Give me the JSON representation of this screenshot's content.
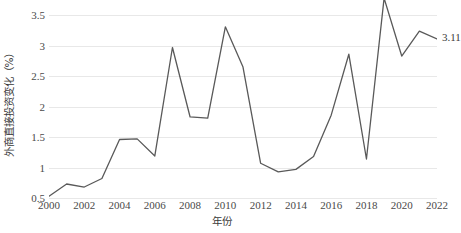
{
  "chart_data": {
    "type": "line",
    "title": "",
    "xlabel": "年份",
    "ylabel": "外商直接投资变化（%）",
    "x": [
      2000,
      2001,
      2002,
      2003,
      2004,
      2005,
      2006,
      2007,
      2008,
      2009,
      2010,
      2011,
      2012,
      2013,
      2014,
      2015,
      2016,
      2017,
      2018,
      2019,
      2020,
      2021,
      2022
    ],
    "values": [
      0.53,
      0.73,
      0.68,
      0.82,
      1.46,
      1.47,
      1.19,
      2.97,
      1.83,
      1.81,
      3.31,
      2.65,
      1.07,
      0.93,
      0.97,
      1.18,
      1.86,
      2.86,
      1.14,
      3.78,
      2.83,
      3.24,
      3.11
    ],
    "series": [
      {
        "name": "外商直接投资变化",
        "values": [
          0.53,
          0.73,
          0.68,
          0.82,
          1.46,
          1.47,
          1.19,
          2.97,
          1.83,
          1.81,
          3.31,
          2.65,
          1.07,
          0.93,
          0.97,
          1.18,
          1.86,
          2.86,
          1.14,
          3.78,
          2.83,
          3.24,
          3.11
        ],
        "color": "#595959"
      }
    ],
    "xlim": [
      2000,
      2022
    ],
    "ylim": [
      0.5,
      3.75
    ],
    "xticks": [
      2000,
      2002,
      2004,
      2006,
      2008,
      2010,
      2012,
      2014,
      2016,
      2018,
      2020,
      2022
    ],
    "xtick_labels": [
      "2000",
      "2002",
      "2004",
      "2006",
      "2008",
      "2010",
      "2012",
      "2014",
      "2016",
      "2018",
      "2020",
      "2022"
    ],
    "yticks": [
      0.5,
      1,
      1.5,
      2,
      2.5,
      3,
      3.5
    ],
    "ytick_labels": [
      "0.5",
      "1",
      "1.5",
      "2",
      "2.5",
      "3",
      "3.5"
    ],
    "grid": "horizontal",
    "legend": "none",
    "annotations": [
      {
        "text": "3.11",
        "x": 2022,
        "y": 3.11
      }
    ],
    "colors": {
      "line": "#595959",
      "gridline": "#e8e8e8",
      "text": "#3a3a3a",
      "background": "#ffffff"
    }
  }
}
